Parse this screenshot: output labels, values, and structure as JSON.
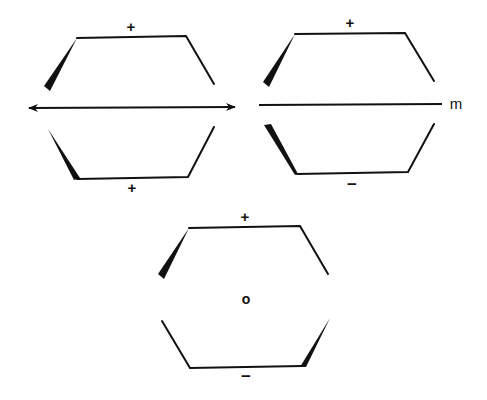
{
  "figure": {
    "panels": [
      {
        "id": "twofold-axis",
        "upper_sign": "+",
        "lower_sign": "+",
        "element": "double-headed-arrow"
      },
      {
        "id": "mirror-plane",
        "upper_sign": "+",
        "lower_sign": "−",
        "element_label": "m"
      },
      {
        "id": "inversion-center",
        "upper_sign": "+",
        "lower_sign": "−",
        "center_label": "o"
      }
    ]
  },
  "colors": {
    "ink": "#111111",
    "background": "#ffffff"
  }
}
